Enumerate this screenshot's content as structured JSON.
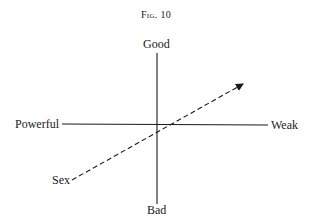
{
  "figure": {
    "title_prefix": "Fig.",
    "title_number": "10"
  },
  "axes": {
    "vertical": {
      "top_label": "Good",
      "bottom_label": "Bad"
    },
    "horizontal": {
      "left_label": "Powerful",
      "right_label": "Weak"
    },
    "dashed_vector": {
      "start_label": "Sex",
      "style": "dashed",
      "arrow": "end"
    }
  },
  "colors": {
    "ink": "#1a1a1a",
    "background": "#ffffff"
  }
}
